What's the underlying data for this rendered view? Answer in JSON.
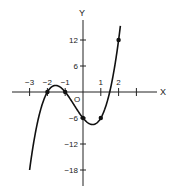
{
  "chart_data": {
    "type": "line",
    "title": "",
    "xlabel": "X",
    "ylabel": "Y",
    "origin_label": "O",
    "x_ticks": [
      -3,
      -2,
      -1,
      1,
      2,
      3
    ],
    "x_tick_labels": [
      "-3",
      "-2",
      "-1",
      "1",
      "2",
      ""
    ],
    "y_ticks": [
      12,
      6,
      -6,
      -12,
      -18
    ],
    "y_tick_labels": [
      "12",
      "6",
      "-6",
      "-12",
      "-18"
    ],
    "xlim": [
      -3.8,
      3.8
    ],
    "ylim": [
      -20,
      19
    ],
    "grid": false,
    "legend": null,
    "series": [
      {
        "name": "y = 2x^3 + 3x^2 - 5x - 6",
        "x": [
          -3.0,
          -2.75,
          -2.5,
          -2.25,
          -2.0,
          -1.75,
          -1.5,
          -1.25,
          -1.0,
          -0.75,
          -0.5,
          -0.25,
          0.0,
          0.25,
          0.5,
          0.75,
          1.0,
          1.25,
          1.5,
          1.75,
          2.0,
          2.1
        ],
        "values": [
          -18,
          -10.86,
          -5.5,
          -1.73,
          0,
          0.69,
          0.75,
          0.47,
          0,
          -0.61,
          -3.0,
          -4.59,
          -6,
          -7.03,
          -7.5,
          -7.22,
          -6,
          -3.66,
          0,
          5.05,
          12,
          15.25
        ]
      }
    ],
    "marked_points": [
      {
        "x": -2,
        "y": 0
      },
      {
        "x": -1,
        "y": 0
      },
      {
        "x": 0,
        "y": -6
      },
      {
        "x": 1,
        "y": -6
      },
      {
        "x": 2,
        "y": 12
      }
    ]
  }
}
